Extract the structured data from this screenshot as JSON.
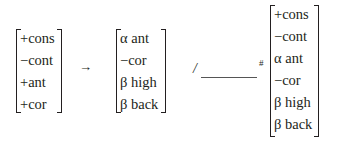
{
  "rule": {
    "input_matrix": {
      "features": [
        "+cons",
        "−cont",
        "+ant",
        "+cor"
      ]
    },
    "arrow": "→",
    "output_matrix": {
      "features": [
        "α ant",
        "−cor",
        "β high",
        "β back"
      ]
    },
    "environment": {
      "slash": "/",
      "boundary": "#",
      "context_matrix": {
        "features": [
          "+cons",
          "−cont",
          "α ant",
          "−cor",
          "β high",
          "β back"
        ]
      }
    }
  }
}
